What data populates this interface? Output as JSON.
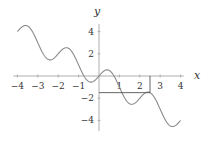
{
  "chart_data": {
    "type": "line",
    "title": "",
    "function": "y = -x + sin(pi x)",
    "xlabel": "x",
    "ylabel": "y",
    "xlim": [
      -4,
      4
    ],
    "ylim": [
      -4.6,
      4.6
    ],
    "grid": false,
    "legend": null,
    "x_ticks": [
      -4,
      -3,
      -2,
      -1,
      1,
      2,
      3,
      4
    ],
    "x_tick_labels": [
      "−4",
      "−3",
      "−2",
      "−1",
      "1",
      "2",
      "3",
      "4"
    ],
    "y_ticks": [
      4,
      2,
      -2,
      -4
    ],
    "y_tick_labels": [
      "4",
      "2",
      "−2",
      "−4"
    ],
    "series": [
      {
        "name": "f(x)",
        "x": [
          -4,
          -3.8,
          -3.6,
          -3.5,
          -3.4,
          -3.2,
          -3,
          -2.8,
          -2.6,
          -2.5,
          -2.4,
          -2.2,
          -2,
          -1.8,
          -1.6,
          -1.5,
          -1.4,
          -1.2,
          -1,
          -0.8,
          -0.6,
          -0.5,
          -0.4,
          -0.2,
          0,
          0.2,
          0.4,
          0.5,
          0.6,
          0.8,
          1,
          1.2,
          1.4,
          1.5,
          1.6,
          1.8,
          2,
          2.2,
          2.4,
          2.5,
          2.6,
          2.8,
          3,
          3.2,
          3.4,
          3.5,
          3.6,
          3.8,
          4
        ],
        "values": [
          4.0,
          4.39,
          4.55,
          4.5,
          4.35,
          3.79,
          3.0,
          2.21,
          1.65,
          1.5,
          1.45,
          1.61,
          2.0,
          2.39,
          2.55,
          2.5,
          2.35,
          1.79,
          1.0,
          0.21,
          -0.35,
          -0.5,
          -0.55,
          -0.39,
          0.0,
          0.39,
          0.55,
          0.5,
          0.35,
          -0.21,
          -1.0,
          -1.79,
          -2.35,
          -2.5,
          -2.55,
          -2.39,
          -2.0,
          -1.61,
          -1.45,
          -1.5,
          -1.65,
          -2.21,
          -3.0,
          -3.79,
          -4.35,
          -4.5,
          -4.55,
          -4.39,
          -4.0
        ]
      }
    ],
    "annotations": [
      {
        "type": "vertical-segment",
        "x": 2.5,
        "y_from": 0,
        "y_to": -1.5
      },
      {
        "type": "horizontal-segment",
        "y": -1.5,
        "x_from": 0,
        "x_to": 2.5
      }
    ],
    "colors": {
      "curve": "#8a8a8a",
      "axes": "#9a9a9a",
      "guides": "#555555",
      "text": "#333333"
    }
  }
}
